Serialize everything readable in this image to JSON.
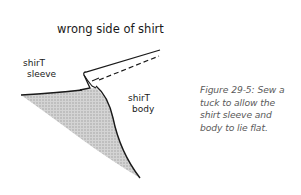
{
  "illustration": {
    "labels": {
      "top": "wrong side of shirt",
      "sleeve_line1": "shirT",
      "sleeve_line2": "sleeve",
      "body_line1": "shirT",
      "body_line2": "body"
    },
    "colors": {
      "ink": "#1a1a1a",
      "shading": "#c8c8c8",
      "caption": "#5a5a5a"
    }
  },
  "caption": {
    "text": "Figure 29-5: Sew a tuck to allow the shirt sleeve and body to lie flat.",
    "lines": [
      "Figure 29-5: Sew a",
      "tuck to allow the",
      "shirt sleeve and",
      "body to lie flat."
    ]
  }
}
